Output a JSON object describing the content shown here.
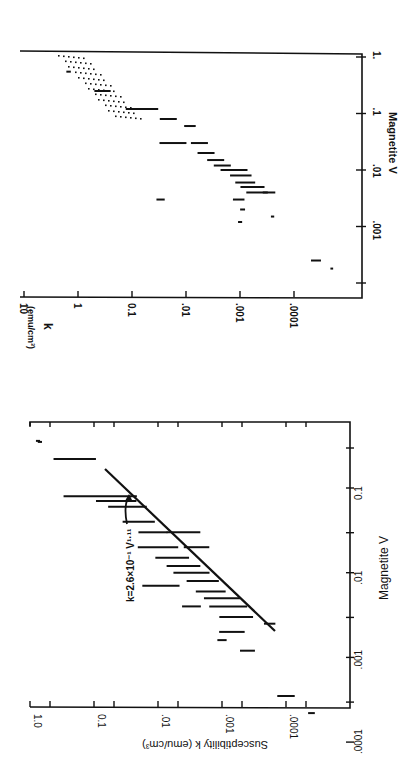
{
  "figure": {
    "ink_color": "#111111",
    "background": "#ffffff"
  },
  "chart_data": [
    {
      "id": "left_plot",
      "type": "scatter",
      "rotation": "90deg counter-clockwise (text reads bottom-to-top)",
      "title": "",
      "xlabel": "Magnetite  V",
      "ylabel": "Susceptibility  k  (emu/cm³)",
      "x_scale": "log",
      "y_scale": "log",
      "xlim": [
        0.0001,
        0.5
      ],
      "ylim": [
        1e-05,
        1.0
      ],
      "x_ticks": [
        ".0001",
        ".001",
        ".01",
        "0.1"
      ],
      "y_ticks": [
        "1.0",
        "0.1",
        ".01",
        ".001",
        ".0001"
      ],
      "grid": false,
      "annotation": "k=2.6×10⁻¹ V¹·¹¹",
      "fit_line": {
        "equation": "k = 2.6e-1 * V^1.11",
        "V_range": [
          0.0008,
          0.2
        ]
      },
      "series": [
        {
          "name": "samples (horizontal bars = V range)",
          "points": [
            {
              "V": 0.35,
              "k": 0.7,
              "V_lo": 0.33,
              "V_hi": 0.37
            },
            {
              "V": 0.36,
              "k": 0.75,
              "V_lo": 0.34,
              "V_hi": 0.38
            },
            {
              "V": 0.22,
              "k": 0.2,
              "V_lo": 0.12,
              "V_hi": 0.38
            },
            {
              "V": 0.08,
              "k": 0.08,
              "V_lo": 0.03,
              "V_hi": 0.22
            },
            {
              "V": 0.07,
              "k": 0.045,
              "V_lo": 0.04,
              "V_hi": 0.12
            },
            {
              "V": 0.04,
              "k": 0.02,
              "V_lo": 0.025,
              "V_hi": 0.06
            },
            {
              "V": 0.06,
              "k": 0.03,
              "V_lo": 0.035,
              "V_hi": 0.1
            },
            {
              "V": 0.03,
              "k": 0.012,
              "V_lo": 0.025,
              "V_hi": 0.055
            },
            {
              "V": 0.02,
              "k": 0.01,
              "V_lo": 0.01,
              "V_hi": 0.03
            },
            {
              "V": 0.03,
              "k": 0.004,
              "V_lo": 0.02,
              "V_hi": 0.05
            },
            {
              "V": 0.015,
              "k": 0.006,
              "V_lo": 0.01,
              "V_hi": 0.025
            },
            {
              "V": 0.012,
              "k": 0.004,
              "V_lo": 0.008,
              "V_hi": 0.02
            },
            {
              "V": 0.01,
              "k": 0.003,
              "V_lo": 0.006,
              "V_hi": 0.016
            },
            {
              "V": 0.008,
              "k": 0.002,
              "V_lo": 0.005,
              "V_hi": 0.012
            },
            {
              "V": 0.006,
              "k": 0.0015,
              "V_lo": 0.004,
              "V_hi": 0.009
            },
            {
              "V": 0.005,
              "k": 0.001,
              "V_lo": 0.003,
              "V_hi": 0.008
            },
            {
              "V": 0.004,
              "k": 0.0008,
              "V_lo": 0.0025,
              "V_hi": 0.007
            },
            {
              "V": 0.003,
              "k": 0.0006,
              "V_lo": 0.002,
              "V_hi": 0.005
            },
            {
              "V": 0.007,
              "k": 0.009,
              "V_lo": 0.004,
              "V_hi": 0.011
            },
            {
              "V": 0.02,
              "k": 0.0025,
              "V_lo": 0.015,
              "V_hi": 0.03
            },
            {
              "V": 0.004,
              "k": 0.003,
              "V_lo": 0.003,
              "V_hi": 0.005
            },
            {
              "V": 0.002,
              "k": 0.0007,
              "V_lo": 0.0015,
              "V_hi": 0.003
            },
            {
              "V": 0.0012,
              "k": 0.0004,
              "V_lo": 0.001,
              "V_hi": 0.0015
            },
            {
              "V": 0.0025,
              "k": 0.00018,
              "V_lo": 0.0022,
              "V_hi": 0.003
            },
            {
              "V": 0.0016,
              "k": 0.001,
              "V_lo": 0.0014,
              "V_hi": 0.0018
            },
            {
              "V": 0.00035,
              "k": 0.0001,
              "V_lo": 0.00028,
              "V_hi": 0.00045
            },
            {
              "V": 0.00022,
              "k": 4e-05,
              "V_lo": 0.0002,
              "V_hi": 0.00024
            }
          ]
        }
      ]
    },
    {
      "id": "right_plot",
      "type": "scatter",
      "rotation": "90deg clockwise (text reads top-to-bottom)",
      "title": "",
      "xlabel": "Magnetite  V",
      "ylabel": "k (emu/cm³)",
      "x_scale": "log",
      "y_scale": "log",
      "xlim": [
        0.0001,
        1.0
      ],
      "ylim": [
        1e-05,
        10
      ],
      "x_ticks": [
        ".001",
        ".01",
        ".1",
        "1."
      ],
      "y_ticks": [
        "10",
        "1",
        "0.1",
        ".01",
        ".001",
        ".0001"
      ],
      "grid": false,
      "shaded_region": {
        "description": "stippled band",
        "V_range": [
          0.1,
          1.0
        ],
        "k_range": [
          0.05,
          6
        ]
      },
      "series": [
        {
          "name": "samples (horizontal bars = V range)",
          "points": [
            {
              "V": 0.55,
              "k": 1.5,
              "V_lo": 0.5,
              "V_hi": 0.6
            },
            {
              "V": 0.25,
              "k": 0.35,
              "V_lo": 0.18,
              "V_hi": 0.35
            },
            {
              "V": 0.12,
              "k": 0.05,
              "V_lo": 0.08,
              "V_hi": 0.3
            },
            {
              "V": 0.08,
              "k": 0.02,
              "V_lo": 0.06,
              "V_hi": 0.12
            },
            {
              "V": 0.03,
              "k": 0.015,
              "V_lo": 0.02,
              "V_hi": 0.06
            },
            {
              "V": 0.06,
              "k": 0.008,
              "V_lo": 0.05,
              "V_hi": 0.08
            },
            {
              "V": 0.03,
              "k": 0.006,
              "V_lo": 0.02,
              "V_hi": 0.04
            },
            {
              "V": 0.02,
              "k": 0.004,
              "V_lo": 0.015,
              "V_hi": 0.03
            },
            {
              "V": 0.015,
              "k": 0.003,
              "V_lo": 0.01,
              "V_hi": 0.02
            },
            {
              "V": 0.012,
              "k": 0.002,
              "V_lo": 0.009,
              "V_hi": 0.018
            },
            {
              "V": 0.01,
              "k": 0.0015,
              "V_lo": 0.005,
              "V_hi": 0.015
            },
            {
              "V": 0.008,
              "k": 0.001,
              "V_lo": 0.005,
              "V_hi": 0.012
            },
            {
              "V": 0.006,
              "k": 0.0008,
              "V_lo": 0.004,
              "V_hi": 0.009
            },
            {
              "V": 0.005,
              "k": 0.0006,
              "V_lo": 0.003,
              "V_hi": 0.008
            },
            {
              "V": 0.004,
              "k": 0.0005,
              "V_lo": 0.0025,
              "V_hi": 0.006
            },
            {
              "V": 0.004,
              "k": 0.0003,
              "V_lo": 0.003,
              "V_hi": 0.005
            },
            {
              "V": 0.003,
              "k": 0.001,
              "V_lo": 0.0025,
              "V_hi": 0.004
            },
            {
              "V": 0.002,
              "k": 0.0009,
              "V_lo": 0.0018,
              "V_hi": 0.0022
            },
            {
              "V": 0.0015,
              "k": 0.00025,
              "V_lo": 0.0014,
              "V_hi": 0.0016
            },
            {
              "V": 0.0012,
              "k": 0.001,
              "V_lo": 0.0011,
              "V_hi": 0.0013
            },
            {
              "V": 0.003,
              "k": 0.03,
              "V_lo": 0.0025,
              "V_hi": 0.0035
            },
            {
              "V": 0.00025,
              "k": 4e-05,
              "V_lo": 0.0002,
              "V_hi": 0.0003
            },
            {
              "V": 0.00018,
              "k": 2e-05,
              "V_lo": 0.00017,
              "V_hi": 0.00019
            }
          ]
        }
      ]
    }
  ],
  "labels": {
    "left": {
      "ylabel": "Susceptibility  k  (emu/cm³)",
      "xlabel": "Magnetite  V",
      "annotation": "k=2.6×10⁻¹ V¹·¹¹",
      "y_ticks": [
        "1.0",
        "0.1",
        ".01",
        ".001",
        ".0001"
      ],
      "x_ticks": [
        ".0001",
        ".001",
        ".01",
        "0.1"
      ]
    },
    "right": {
      "ylabel_k": "k",
      "ylabel_units": "(emu/cm³)",
      "xlabel": "Magnetite  V",
      "y_ticks": [
        "10",
        "1",
        "0.1",
        ".01",
        ".001",
        ".0001"
      ],
      "x_ticks": [
        ".001",
        ".01",
        ".1",
        "1."
      ]
    }
  }
}
